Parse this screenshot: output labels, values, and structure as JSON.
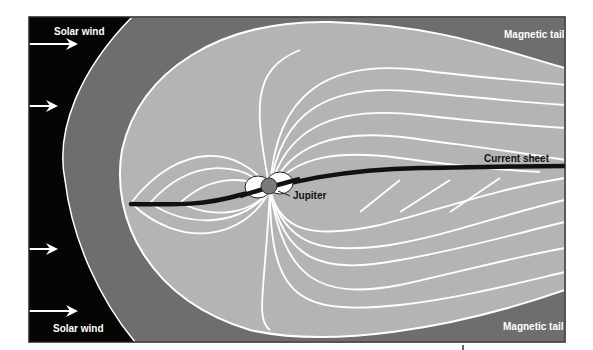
{
  "diagram": {
    "labels": {
      "solar_wind_top": "Solar wind",
      "solar_wind_bottom": "Solar wind",
      "magnetic_tail_top": "Magnetic tail",
      "magnetic_tail_bottom": "Magnetic tail",
      "current_sheet": "Current sheet",
      "planet": "Jupiter"
    },
    "colors": {
      "solar_wind_region": "#050505",
      "magnetosheath": "#6e6e6e",
      "magnetosphere": "#b4b4b4",
      "field_lines": "#ffffff",
      "current_sheet": "#111111",
      "planet": "#7a7a7a"
    },
    "arrow_count": 4
  }
}
